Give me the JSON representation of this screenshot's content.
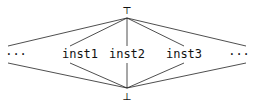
{
  "diagram": {
    "type": "lattice",
    "top": {
      "label": "⊤",
      "x": 127,
      "y": 10
    },
    "bottom": {
      "label": "⊥",
      "x": 127,
      "y": 96
    },
    "nodes": [
      {
        "id": "left-ellipsis",
        "label": "···",
        "x": 16,
        "y": 54
      },
      {
        "id": "inst1",
        "label": "inst1",
        "x": 80,
        "y": 54
      },
      {
        "id": "inst2",
        "label": "inst2",
        "x": 127,
        "y": 54
      },
      {
        "id": "inst3",
        "label": "inst3",
        "x": 184,
        "y": 54
      },
      {
        "id": "right-ellipsis",
        "label": "···",
        "x": 239,
        "y": 54
      }
    ],
    "edges": [
      [
        "top",
        "left-ellipsis"
      ],
      [
        "top",
        "inst1"
      ],
      [
        "top",
        "inst2"
      ],
      [
        "top",
        "inst3"
      ],
      [
        "top",
        "right-ellipsis"
      ],
      [
        "left-ellipsis",
        "bottom"
      ],
      [
        "inst1",
        "bottom"
      ],
      [
        "inst2",
        "bottom"
      ],
      [
        "inst3",
        "bottom"
      ],
      [
        "right-ellipsis",
        "bottom"
      ]
    ],
    "line_color": "#222222"
  }
}
